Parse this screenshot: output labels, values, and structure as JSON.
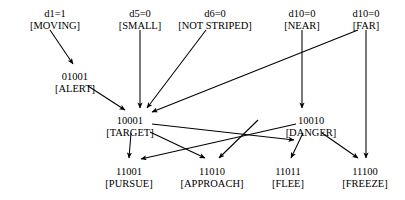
{
  "diagram": {
    "type": "directed-graph",
    "inputs": [
      {
        "id": "moving",
        "condition": "d1=1",
        "label": "[MOVING]",
        "x": 55,
        "y": 8
      },
      {
        "id": "small",
        "condition": "d5=0",
        "label": "[SMALL]",
        "x": 140,
        "y": 8
      },
      {
        "id": "not_striped",
        "condition": "d6=0",
        "label": "[NOT STRIPED]",
        "x": 215,
        "y": 8
      },
      {
        "id": "near",
        "condition": "d10=0",
        "label": "[NEAR]",
        "x": 302,
        "y": 8
      },
      {
        "id": "far",
        "condition": "d10=0",
        "label": "[FAR]",
        "x": 366,
        "y": 8
      }
    ],
    "states": [
      {
        "id": "alert",
        "code": "01001",
        "label": "[ALERT]",
        "x": 75,
        "y": 71
      },
      {
        "id": "target",
        "code": "10001",
        "label": "[TARGET]",
        "x": 130,
        "y": 115
      },
      {
        "id": "danger",
        "code": "10010",
        "label": "[DANGER]",
        "x": 311,
        "y": 115
      },
      {
        "id": "pursue",
        "code": "11001",
        "label": "[PURSUE]",
        "x": 129,
        "y": 166
      },
      {
        "id": "approach",
        "code": "11010",
        "label": "[APPROACH]",
        "x": 212,
        "y": 166
      },
      {
        "id": "flee",
        "code": "11011",
        "label": "[FLEE]",
        "x": 288,
        "y": 166
      },
      {
        "id": "freeze",
        "code": "11100",
        "label": "[FREEZE]",
        "x": 365,
        "y": 166
      }
    ],
    "edges": [
      {
        "from": "moving",
        "to": "alert"
      },
      {
        "from": "small",
        "to": "target"
      },
      {
        "from": "not_striped",
        "to": "target"
      },
      {
        "from": "alert",
        "to": "target"
      },
      {
        "from": "far",
        "to": "target"
      },
      {
        "from": "near",
        "to": "danger"
      },
      {
        "from": "target",
        "to": "danger"
      },
      {
        "from": "target",
        "to": "pursue"
      },
      {
        "from": "target",
        "to": "approach"
      },
      {
        "from": "near",
        "to": "pursue"
      },
      {
        "from": "not_striped",
        "to": "approach"
      },
      {
        "from": "danger",
        "to": "flee"
      },
      {
        "from": "danger",
        "to": "freeze"
      },
      {
        "from": "far",
        "to": "freeze"
      }
    ],
    "colors": {
      "stroke": "#000000",
      "text": "#000000",
      "background": "#ffffff"
    }
  }
}
